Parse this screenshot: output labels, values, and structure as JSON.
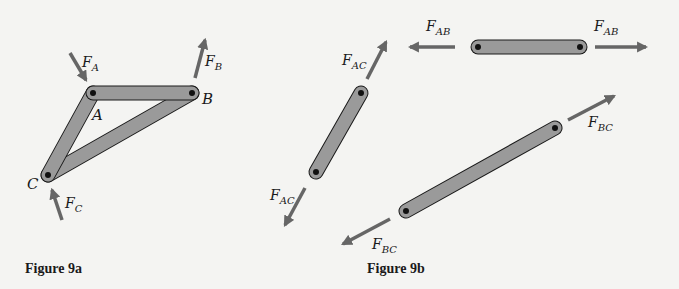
{
  "colors": {
    "background": "#f4f4f2",
    "bar_fill": "#9a9a9a",
    "bar_stroke": "#1a1a1a",
    "arrow": "#666666",
    "pin": "#111111",
    "text": "#1a1a1a"
  },
  "figure_a": {
    "caption": "Figure 9a",
    "points": {
      "A": "A",
      "B": "B",
      "C": "C"
    },
    "forces": {
      "FA": {
        "main": "F",
        "sub": "A"
      },
      "FB": {
        "main": "F",
        "sub": "B"
      },
      "FC": {
        "main": "F",
        "sub": "C"
      }
    }
  },
  "figure_b": {
    "caption": "Figure 9b",
    "forces": {
      "FAB_left": {
        "main": "F",
        "sub": "AB"
      },
      "FAB_right": {
        "main": "F",
        "sub": "AB"
      },
      "FAC_top": {
        "main": "F",
        "sub": "AC"
      },
      "FAC_bottom": {
        "main": "F",
        "sub": "AC"
      },
      "FBC_top": {
        "main": "F",
        "sub": "BC"
      },
      "FBC_bottom": {
        "main": "F",
        "sub": "BC"
      }
    }
  }
}
